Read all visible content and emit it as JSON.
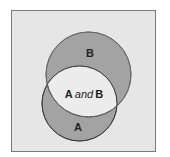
{
  "diagram": {
    "type": "venn",
    "frame": {
      "fill": "#e6e6e6",
      "stroke": "#7a7a7a"
    },
    "sets": [
      {
        "id": "A",
        "label": "A",
        "fill": "#a3a3a3",
        "stroke": "#5a5a5a"
      },
      {
        "id": "B",
        "label": "B",
        "fill": "#a3a3a3",
        "stroke": "#5a5a5a"
      }
    ],
    "intersection": {
      "label_part1": "A",
      "label_conj": "and",
      "label_part2": "B",
      "fill": "#ececec"
    }
  }
}
